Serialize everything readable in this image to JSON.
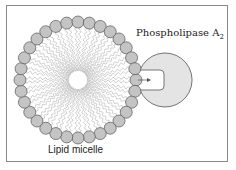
{
  "diagram": {
    "enzyme_label": "Phospholipase A",
    "enzyme_subscript": "2",
    "micelle_label": "Lipid micelle",
    "colors": {
      "bead": "#c4c4c4",
      "enzyme": "#e4e4e4",
      "outline": "#555555",
      "tail": "#8a8a8a"
    }
  }
}
